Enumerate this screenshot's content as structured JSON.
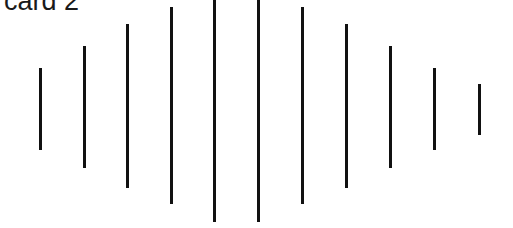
{
  "card": {
    "label": "card 2",
    "line_color": "#111111",
    "background": "#ffffff"
  },
  "lines": [
    {
      "x": 39,
      "top": 68,
      "bottom": 150
    },
    {
      "x": 83,
      "top": 46,
      "bottom": 168
    },
    {
      "x": 126,
      "top": 24,
      "bottom": 188
    },
    {
      "x": 170,
      "top": 7,
      "bottom": 204
    },
    {
      "x": 213,
      "top": 0,
      "bottom": 222
    },
    {
      "x": 257,
      "top": 0,
      "bottom": 222
    },
    {
      "x": 301,
      "top": 7,
      "bottom": 204
    },
    {
      "x": 345,
      "top": 24,
      "bottom": 188
    },
    {
      "x": 389,
      "top": 46,
      "bottom": 168
    },
    {
      "x": 433,
      "top": 68,
      "bottom": 150
    },
    {
      "x": 478,
      "top": 84,
      "bottom": 135
    }
  ]
}
